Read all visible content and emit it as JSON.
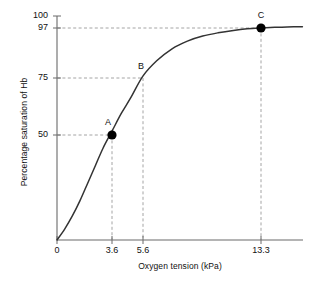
{
  "chart_data": {
    "type": "line",
    "title": "",
    "xlabel": "Oxygen tension (kPa)",
    "ylabel": "Percentage saturation of Hb",
    "xlim": [
      0,
      16
    ],
    "ylim": [
      0,
      100
    ],
    "grid": false,
    "legend": "none",
    "x_ticks": [
      {
        "value": 0,
        "label": "0"
      },
      {
        "value": 3.6,
        "label": "3.6"
      },
      {
        "value": 5.6,
        "label": "5.6"
      },
      {
        "value": 13.3,
        "label": "13.3"
      }
    ],
    "y_ticks": [
      {
        "value": 50,
        "label": "50"
      },
      {
        "value": 75,
        "label": "75"
      },
      {
        "value": 97,
        "label": "97"
      },
      {
        "value": 100,
        "label": "100"
      }
    ],
    "series": [
      {
        "name": "Oxygen dissociation curve",
        "color": "#333333",
        "x": [
          0,
          0.5,
          1.0,
          1.5,
          2.0,
          2.5,
          3.0,
          3.6,
          4.2,
          4.8,
          5.6,
          6.5,
          7.5,
          8.5,
          9.5,
          10.5,
          11.5,
          12.4,
          13.3,
          14.2,
          15.0,
          16.0
        ],
        "y": [
          0,
          5,
          11,
          18,
          26,
          34,
          42,
          50,
          58,
          65,
          75,
          82,
          87.5,
          91,
          93.3,
          94.8,
          95.9,
          96.6,
          97,
          97.3,
          97.5,
          97.6
        ]
      }
    ],
    "annotations": [
      {
        "label": "A",
        "x": 3.6,
        "y": 50,
        "marker": "filled-circle",
        "guides": [
          "horizontal",
          "vertical"
        ]
      },
      {
        "label": "B",
        "x": 5.6,
        "y": 75,
        "marker": "none",
        "guides": [
          "horizontal",
          "vertical"
        ]
      },
      {
        "label": "C",
        "x": 13.3,
        "y": 97,
        "marker": "filled-circle",
        "guides": [
          "horizontal",
          "vertical"
        ]
      }
    ],
    "colors": {
      "curve": "#333333",
      "axis": "#555555",
      "guide": "#999999",
      "marker": "#000000",
      "text": "#111111",
      "background": "#ffffff"
    }
  }
}
